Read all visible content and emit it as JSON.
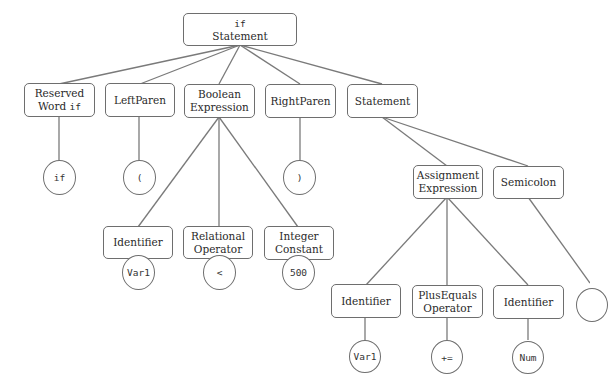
{
  "diagram": {
    "type": "parse-tree",
    "root": {
      "line1": "if",
      "line2": "Statement"
    },
    "level1": {
      "reserved_word": {
        "line1": "Reserved",
        "line2_text": "Word ",
        "line2_code": "if"
      },
      "left_paren": {
        "label": "LeftParen"
      },
      "boolean_expression": {
        "line1": "Boolean",
        "line2": "Expression"
      },
      "right_paren": {
        "label": "RightParen"
      },
      "statement": {
        "label": "Statement"
      }
    },
    "tokens_level1": {
      "if": "if",
      "left_paren": "(",
      "right_paren": ")"
    },
    "boolean_children": {
      "identifier": {
        "label": "Identifier"
      },
      "relational_operator": {
        "line1": "Relational",
        "line2": "Operator"
      },
      "integer_constant": {
        "line1": "Integer",
        "line2": "Constant"
      }
    },
    "boolean_tokens": {
      "identifier": "Var1",
      "relational": "<",
      "integer": "500"
    },
    "statement_children": {
      "assignment_expression": {
        "line1": "Assignment",
        "line2": "Expression"
      },
      "semicolon": {
        "label": "Semicolon"
      }
    },
    "assignment_children": {
      "identifier_left": {
        "label": "Identifier"
      },
      "plus_equals": {
        "line1": "PlusEquals",
        "line2": "Operator"
      },
      "identifier_right": {
        "label": "Identifier"
      }
    },
    "assignment_tokens": {
      "identifier_left": "Var1",
      "plus_equals": "+=",
      "identifier_right": "Num"
    },
    "semicolon_token": ""
  }
}
